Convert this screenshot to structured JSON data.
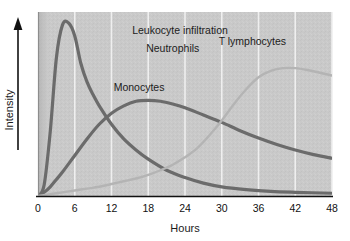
{
  "chart_data": {
    "type": "line",
    "title": "Leukocyte infiltration",
    "xlabel": "Hours",
    "ylabel": "Intensity",
    "xlim": [
      0,
      48
    ],
    "ylim": [
      0,
      1
    ],
    "xticks": [
      "0",
      "6",
      "12",
      "18",
      "24",
      "30",
      "36",
      "42",
      "48"
    ],
    "xtick_values": [
      0,
      6,
      12,
      18,
      24,
      30,
      36,
      42,
      48
    ],
    "yticks": [],
    "grid": "vertical-only",
    "legend_position": "inline-labels",
    "background_color": "#c9c9c9",
    "series": [
      {
        "name": "Neutrophils",
        "color": "#6b6b6b",
        "line_width": 3.2,
        "label_x": 22,
        "label_y": 0.78,
        "x": [
          0,
          1,
          2,
          3,
          4,
          5,
          6,
          7,
          8,
          9,
          10,
          12,
          14,
          16,
          18,
          21,
          24,
          27,
          30,
          34,
          38,
          42,
          48
        ],
        "y": [
          0.0,
          0.06,
          0.35,
          0.75,
          0.93,
          0.94,
          0.87,
          0.72,
          0.62,
          0.55,
          0.49,
          0.39,
          0.31,
          0.25,
          0.2,
          0.14,
          0.1,
          0.07,
          0.05,
          0.035,
          0.025,
          0.02,
          0.015
        ]
      },
      {
        "name": "Monocytes",
        "color": "#6b6b6b",
        "line_width": 3.2,
        "label_x": 16.5,
        "label_y": 0.57,
        "x": [
          0,
          1,
          2,
          3,
          4,
          6,
          8,
          10,
          12,
          14,
          16,
          18,
          20,
          22,
          24,
          27,
          30,
          33,
          36,
          39,
          42,
          45,
          48
        ],
        "y": [
          0.0,
          0.02,
          0.05,
          0.09,
          0.13,
          0.22,
          0.31,
          0.39,
          0.45,
          0.49,
          0.515,
          0.52,
          0.515,
          0.5,
          0.48,
          0.44,
          0.4,
          0.355,
          0.315,
          0.28,
          0.25,
          0.225,
          0.205
        ]
      },
      {
        "name": "T lymphocytes",
        "color": "#b4b4b4",
        "line_width": 2.4,
        "label_x": 35,
        "label_y": 0.82,
        "x": [
          0,
          2,
          4,
          6,
          8,
          10,
          12,
          14,
          16,
          18,
          20,
          22,
          24,
          26,
          28,
          30,
          32,
          34,
          36,
          38,
          40,
          42,
          44,
          46,
          48
        ],
        "y": [
          0.0,
          0.01,
          0.02,
          0.03,
          0.04,
          0.05,
          0.065,
          0.08,
          0.095,
          0.115,
          0.14,
          0.17,
          0.21,
          0.26,
          0.33,
          0.41,
          0.5,
          0.58,
          0.645,
          0.68,
          0.695,
          0.695,
          0.685,
          0.67,
          0.655
        ]
      }
    ]
  },
  "axes": {
    "y_arrow_name": "intensity-arrow",
    "x_axis_name": "hours-axis"
  }
}
